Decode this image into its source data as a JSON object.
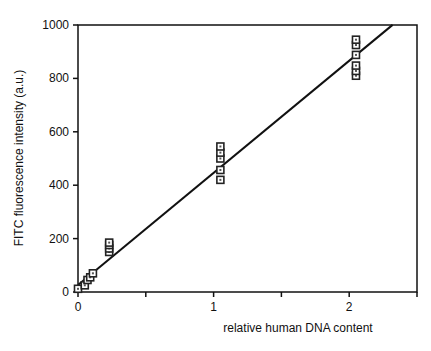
{
  "chart_data": {
    "type": "scatter",
    "title": "",
    "xlabel": "relative human DNA content",
    "ylabel": "FITC fluorescence intensity (a.u.)",
    "xlim": [
      0,
      2.5
    ],
    "ylim": [
      0,
      1000
    ],
    "x_ticks": [
      0,
      0.5,
      1,
      1.5,
      2,
      2.5
    ],
    "x_tick_labels": [
      "0",
      "",
      "1",
      "",
      "2",
      ""
    ],
    "y_ticks": [
      0,
      200,
      400,
      600,
      800,
      1000
    ],
    "y_tick_labels": [
      "0",
      "200",
      "400",
      "600",
      "800",
      "1000"
    ],
    "grid": false,
    "legend": null,
    "marker": "square",
    "series": [
      {
        "name": "measurements",
        "points": [
          {
            "x": 0.0,
            "y": 12
          },
          {
            "x": 0.05,
            "y": 25
          },
          {
            "x": 0.07,
            "y": 45
          },
          {
            "x": 0.09,
            "y": 55
          },
          {
            "x": 0.11,
            "y": 70
          },
          {
            "x": 0.23,
            "y": 150
          },
          {
            "x": 0.23,
            "y": 163
          },
          {
            "x": 0.23,
            "y": 176
          },
          {
            "x": 0.23,
            "y": 185
          },
          {
            "x": 1.05,
            "y": 420
          },
          {
            "x": 1.05,
            "y": 457
          },
          {
            "x": 1.05,
            "y": 500
          },
          {
            "x": 1.05,
            "y": 522
          },
          {
            "x": 1.05,
            "y": 545
          },
          {
            "x": 2.05,
            "y": 810
          },
          {
            "x": 2.05,
            "y": 828
          },
          {
            "x": 2.05,
            "y": 848
          },
          {
            "x": 2.05,
            "y": 888
          },
          {
            "x": 2.05,
            "y": 925
          },
          {
            "x": 2.05,
            "y": 945
          }
        ]
      }
    ],
    "fit_line": {
      "intercept": 26,
      "slope": 420,
      "x_range": [
        0,
        2.32
      ]
    }
  }
}
